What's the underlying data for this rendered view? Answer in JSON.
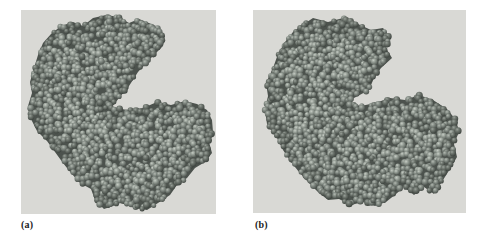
{
  "figure": {
    "type": "molecular-structure-figure",
    "panels": [
      {
        "label": "(a)",
        "description": "space-filling-protein-model-open-conformation"
      },
      {
        "label": "(b)",
        "description": "space-filling-protein-model-closed-conformation"
      }
    ],
    "colors": {
      "page_background": "#ffffff",
      "panel_background": "#d9d9d5",
      "molecule_underlay": "#4c524d",
      "sphere_light": [
        "#c6ccc4",
        "#98a098",
        "#575e58"
      ],
      "sphere_mid": [
        "#b2b8b0",
        "#858d86",
        "#4a504b"
      ],
      "sphere_dark": [
        "#99a099",
        "#6e756e",
        "#3c423d"
      ],
      "label_color": "#1c1c1c"
    }
  }
}
